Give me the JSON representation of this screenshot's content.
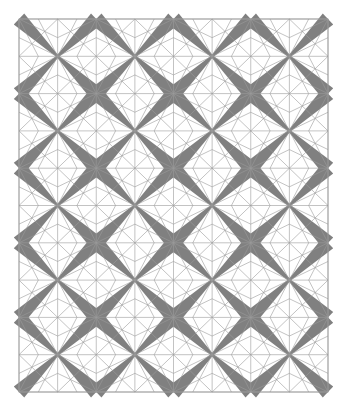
{
  "artwork": {
    "description": "Geometric quilt-like pattern of diamonds with gray X bands and radiating fan lines",
    "canvas": {
      "width": 346,
      "height": 418,
      "background": "#ffffff"
    },
    "grid": {
      "x0": 19,
      "y0": 19,
      "cols": 4,
      "rows": 5,
      "cell_w": 77.25,
      "cell_h": 74.6
    },
    "colors": {
      "band": "#808080",
      "line": "#9a9a9a",
      "border": "#9a9a9a"
    },
    "band": {
      "center_half_width": 1.2,
      "corner_half_width": 7.5
    },
    "fan": {
      "edge_divisions": 4
    }
  }
}
